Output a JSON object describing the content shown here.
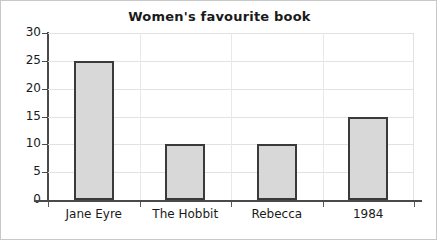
{
  "chart_data": {
    "type": "bar",
    "title": "Women's favourite book",
    "xlabel": "",
    "ylabel": "",
    "categories": [
      "Jane Eyre",
      "The Hobbit",
      "Rebecca",
      "1984"
    ],
    "values": [
      25,
      10,
      10,
      15
    ],
    "ylim": [
      0,
      30
    ],
    "ytick_labels": [
      "0",
      "5",
      "10",
      "15",
      "20",
      "25",
      "30"
    ],
    "ytick_values": [
      0,
      5,
      10,
      15,
      20,
      25,
      30
    ],
    "grid": "horizontal-and-vertical",
    "legend": "none",
    "bar_fill_color": "#d8d8d8",
    "bar_edge_color": "#3a3a3a",
    "gridline_color": "#e2e2e2",
    "axis_color": "#4a4a4a",
    "text_color": "#1a1a1a"
  }
}
